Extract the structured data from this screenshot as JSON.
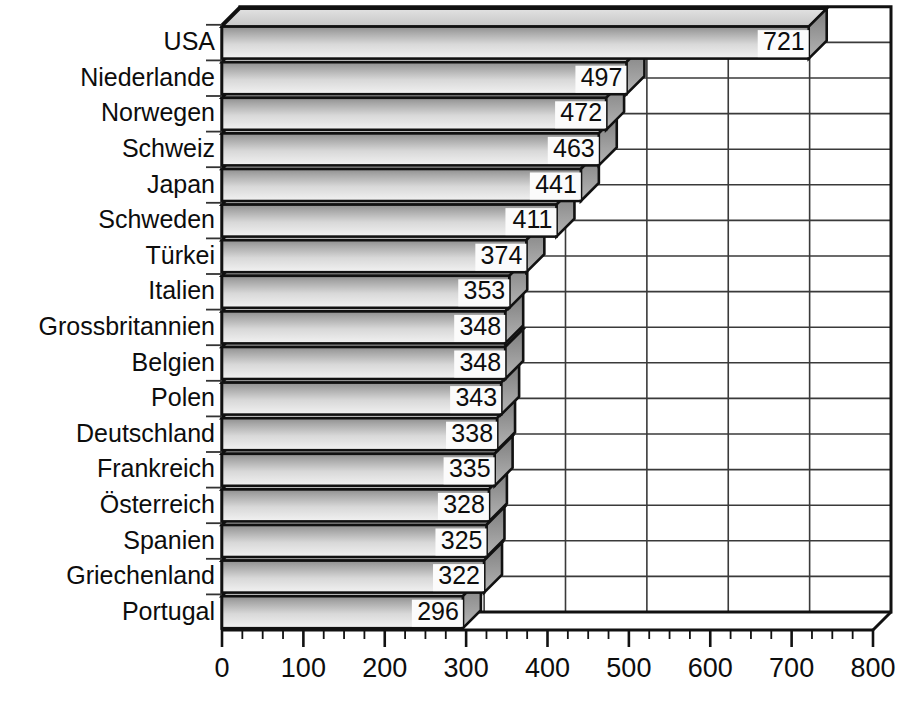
{
  "chart_data": {
    "type": "bar",
    "orientation": "horizontal",
    "style": "3d-bar",
    "title": "",
    "subtitle": "",
    "xlabel": "",
    "ylabel": "",
    "categories": [
      "USA",
      "Niederlande",
      "Norwegen",
      "Schweiz",
      "Japan",
      "Schweden",
      "Türkei",
      "Italien",
      "Grossbritannien",
      "Belgien",
      "Polen",
      "Deutschland",
      "Frankreich",
      "Österreich",
      "Spanien",
      "Griechenland",
      "Portugal"
    ],
    "values": [
      721,
      497,
      472,
      463,
      441,
      411,
      374,
      353,
      348,
      348,
      343,
      338,
      335,
      328,
      325,
      322,
      296
    ],
    "data_labels": [
      "721",
      "497",
      "472",
      "463",
      "441",
      "411",
      "374",
      "353",
      "348",
      "348",
      "343",
      "338",
      "335",
      "328",
      "325",
      "322",
      "296"
    ],
    "xlim": [
      0,
      800
    ],
    "xticks": [
      0,
      100,
      200,
      300,
      400,
      500,
      600,
      700,
      800
    ],
    "xtick_labels": [
      "0",
      "100",
      "200",
      "300",
      "400",
      "500",
      "600",
      "700",
      "800"
    ],
    "minor_tick_step": 25,
    "grid": true,
    "grid_axis": "both",
    "legend": false,
    "legend_position": "none",
    "colors": {
      "bar_face_top": "#9a9a9a",
      "bar_face_bottom": "#efefef",
      "bar_top_face": "#d5d5d5",
      "bar_end_cap": "#8f8f8f",
      "outline": "#111111",
      "grid": "#3a3a3a",
      "background": "#ffffff",
      "label_box": "#fbfbfb",
      "text": "#0d0d0d"
    }
  },
  "axis": {
    "x_axis_name": "value-axis",
    "y_axis_name": "category-axis"
  }
}
